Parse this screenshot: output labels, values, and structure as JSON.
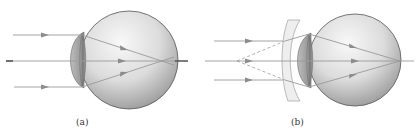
{
  "figure": {
    "panels": [
      {
        "id": "a",
        "label": "(a)",
        "description": "Myopic eye: parallel rays focus in front of the retina",
        "focus": "in front of retina"
      },
      {
        "id": "b",
        "label": "(b)",
        "description": "Myopia corrected with a diverging (concave) lens: rays focus on the retina",
        "corrective_lens": "concave",
        "focus": "on retina"
      }
    ]
  },
  "colors": {
    "ray": "#9a9a9a",
    "arrow": "#8c8c8c",
    "axis_stub": "#444444",
    "eye_outline": "#555555",
    "eye_fill_light": "#f4f4f4",
    "eye_fill_dark": "#9d9d9d",
    "lens": "#8a8a8a",
    "corrective_lens_fill": "#eeeeee",
    "corrective_lens_stroke": "#aaaaaa",
    "label": "#333333"
  }
}
